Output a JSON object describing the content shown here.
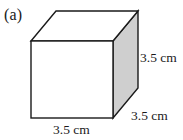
{
  "figure": {
    "panel_label": "(a)",
    "shape_name": "cube",
    "labels": {
      "height": "3.5 cm",
      "depth": "3.5 cm",
      "width": "3.5 cm"
    },
    "colors": {
      "background": "#ffffff",
      "front_face": "#ffffff",
      "top_face": "#ffffff",
      "right_face": "#cfcfcf",
      "outline": "#1a1a1a",
      "text": "#1a1a1a"
    },
    "geometry": {
      "front_top_left": [
        31,
        41
      ],
      "front_top_right": [
        113,
        41
      ],
      "front_bottom_right": [
        113,
        118
      ],
      "front_bottom_left": [
        31,
        118
      ],
      "back_top_left": [
        56,
        11
      ],
      "back_top_right": [
        138,
        11
      ],
      "back_bottom_right": [
        138,
        88
      ]
    }
  }
}
